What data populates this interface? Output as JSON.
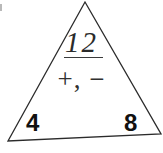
{
  "worksheet": {
    "shape": "fact-family-triangle",
    "top_number": "12",
    "top_number_underlined": true,
    "operators": "+, −",
    "left_number": "4",
    "right_number": "8",
    "line_color": "#2b2b2b",
    "text_color": "#111111",
    "background_color": "#ffffff"
  },
  "geometry": {
    "apex_x": 85,
    "apex_y": 2,
    "left_vertex_x": 8,
    "left_vertex_y": 141,
    "right_vertex_x": 161,
    "right_vertex_y": 134,
    "stroke_width": "1.3"
  },
  "chart_data": {
    "type": "diagram",
    "nodes": [
      {
        "position": "top",
        "label": "12",
        "role": "sum"
      },
      {
        "position": "bottom-left",
        "label": "4",
        "role": "addend"
      },
      {
        "position": "bottom-right",
        "label": "8",
        "role": "addend"
      }
    ],
    "center_label": "+, −",
    "relations": [
      "4 + 8 = 12",
      "8 + 4 = 12",
      "12 − 4 = 8",
      "12 − 8 = 4"
    ]
  }
}
